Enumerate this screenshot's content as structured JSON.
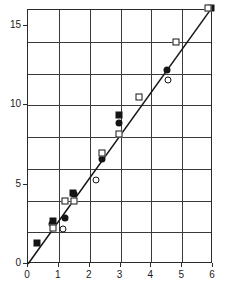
{
  "chart_data": {
    "type": "scatter",
    "title": "Induced point mutations (%)",
    "xlabel": "Dose (kR)",
    "ylabel": "Induced point mutations (%)",
    "xlim": [
      0,
      6
    ],
    "ylim": [
      0,
      16
    ],
    "xticks": [
      "0",
      "1",
      "2",
      "3",
      "4",
      "5",
      "6"
    ],
    "xtick_values": [
      0,
      1,
      2,
      3,
      4,
      5,
      6
    ],
    "yticks": [
      "0",
      "5",
      "10",
      "15"
    ],
    "ytick_values": [
      0,
      5,
      10,
      15
    ],
    "y_gridline_values": [
      2,
      4,
      6,
      8,
      10,
      12,
      14,
      16
    ],
    "x_gridline_values": [
      1,
      2,
      3,
      4,
      5
    ],
    "grid": true,
    "legend": "none",
    "fit_line": {
      "type": "linear",
      "through_origin": true,
      "slope": 2.72,
      "intercept": 0,
      "x_start": 0,
      "y_start": 0,
      "x_end": 5.95,
      "y_end": 16.1
    },
    "series": [
      {
        "name": "filled-square",
        "marker": "filled-square",
        "points": [
          {
            "x": 0.3,
            "y": 1.3
          },
          {
            "x": 0.8,
            "y": 2.7
          },
          {
            "x": 1.45,
            "y": 4.5
          },
          {
            "x": 2.95,
            "y": 9.4
          },
          {
            "x": 5.95,
            "y": 16.1
          }
        ]
      },
      {
        "name": "filled-circle",
        "marker": "filled-circle",
        "points": [
          {
            "x": 0.78,
            "y": 2.5
          },
          {
            "x": 1.2,
            "y": 2.9
          },
          {
            "x": 1.5,
            "y": 4.4
          },
          {
            "x": 2.4,
            "y": 6.6
          },
          {
            "x": 2.95,
            "y": 8.9
          },
          {
            "x": 4.5,
            "y": 12.2
          }
        ]
      },
      {
        "name": "open-square",
        "marker": "open-square",
        "points": [
          {
            "x": 0.8,
            "y": 2.25
          },
          {
            "x": 1.2,
            "y": 4.0
          },
          {
            "x": 1.5,
            "y": 4.0
          },
          {
            "x": 2.4,
            "y": 7.0
          },
          {
            "x": 2.95,
            "y": 8.2
          },
          {
            "x": 3.6,
            "y": 10.5
          },
          {
            "x": 4.8,
            "y": 14.0
          },
          {
            "x": 5.85,
            "y": 16.15
          }
        ]
      },
      {
        "name": "open-circle",
        "marker": "open-circle",
        "points": [
          {
            "x": 1.15,
            "y": 2.2
          },
          {
            "x": 2.2,
            "y": 5.3
          },
          {
            "x": 4.55,
            "y": 11.6
          }
        ]
      }
    ]
  }
}
